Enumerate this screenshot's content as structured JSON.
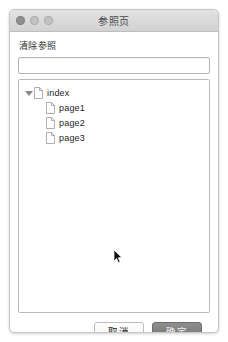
{
  "window": {
    "title": "参照页",
    "traffic_lights": [
      {
        "name": "close-button",
        "color": "#8e8e8e"
      },
      {
        "name": "minimize-button",
        "color": "#c2c2c2"
      },
      {
        "name": "maximize-button",
        "color": "#c2c2c2"
      }
    ]
  },
  "form": {
    "label": "清除参照",
    "filter_value": "",
    "filter_placeholder": ""
  },
  "tree": {
    "nodes": [
      {
        "label": "index",
        "depth": 0,
        "expanded": true,
        "icon": "document-icon"
      },
      {
        "label": "page1",
        "depth": 1,
        "expanded": false,
        "icon": "document-icon"
      },
      {
        "label": "page2",
        "depth": 1,
        "expanded": false,
        "icon": "document-icon"
      },
      {
        "label": "page3",
        "depth": 1,
        "expanded": false,
        "icon": "document-icon"
      }
    ]
  },
  "footer": {
    "cancel_label": "取消",
    "confirm_label": "确定"
  },
  "cursor": {
    "icon": "mouse-pointer-icon",
    "x": 94,
    "y": 169
  }
}
